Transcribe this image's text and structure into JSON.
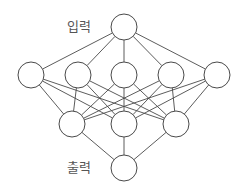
{
  "diagram": {
    "type": "neural-network",
    "labels": {
      "input": "입력",
      "output": "출력"
    },
    "style": {
      "stroke": "#4a4a4a",
      "node_fill": "#ffffff",
      "label_color": "#555555",
      "node_radius": 13
    },
    "layers": [
      {
        "name": "input",
        "nodes": [
          {
            "x": 124,
            "y": 27
          }
        ]
      },
      {
        "name": "hidden-1",
        "nodes": [
          {
            "x": 31,
            "y": 75
          },
          {
            "x": 78,
            "y": 75
          },
          {
            "x": 124,
            "y": 75
          },
          {
            "x": 171,
            "y": 75
          },
          {
            "x": 217,
            "y": 75
          }
        ]
      },
      {
        "name": "hidden-2",
        "nodes": [
          {
            "x": 72,
            "y": 124
          },
          {
            "x": 124,
            "y": 124
          },
          {
            "x": 176,
            "y": 124
          }
        ]
      },
      {
        "name": "output",
        "nodes": [
          {
            "x": 124,
            "y": 168
          }
        ]
      }
    ],
    "connectivity": "fully-connected"
  }
}
